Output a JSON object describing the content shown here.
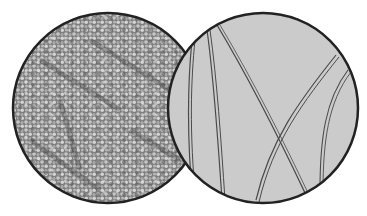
{
  "figure": {
    "background": "#ffffff",
    "left_view": {
      "subject": "granular-cell-texture",
      "center": [
        108,
        108
      ],
      "radius": 95,
      "fill": "#8a8a8a",
      "border": "#222222"
    },
    "right_view": {
      "subject": "fiber-strands",
      "center": [
        263,
        108
      ],
      "radius": 95,
      "fill": "#c9c9c9",
      "border": "#222222",
      "fiber_color": "#4a4a4a"
    }
  }
}
